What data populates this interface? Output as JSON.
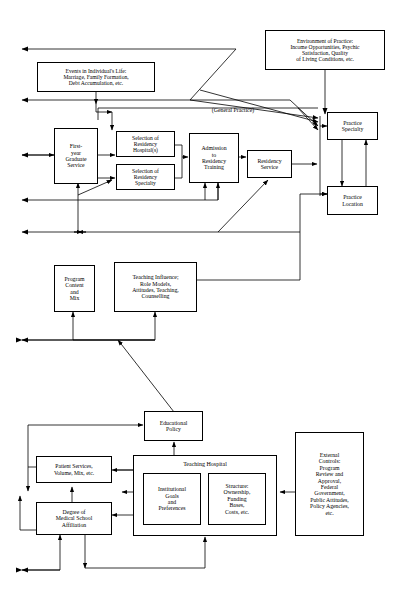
{
  "diagram": {
    "general_practice_label": "(General Practice)",
    "teaching_hospital_label": "Teaching Hospital",
    "nodes": {
      "environment_of_practice": "Environment of Practice: Income Opportunities, Psychic Satisfaction, Quality of Living Conditions, etc.",
      "events_individual_life": "Events in Individual's Life: Marriage, Family Formation, Debt Accumulation, etc.",
      "first_year_graduate_service": "First-year Graduate Service",
      "selection_residency_hospitals": "Selection of Residency Hospital(s)",
      "selection_residency_specialty": "Selection of Residency Specialty",
      "admission_residency_training": "Admission to Residency Training",
      "residency_service": "Residency Service",
      "practice_specialty": "Practice Specialty",
      "practice_location": "Practice Location",
      "program_content_mix": "Program Content and Mix",
      "teaching_influence": "Teaching Influence; Role Models, Attitudes, Teaching, Counselling",
      "educational_policy": "Educational Policy",
      "patient_services": "Patient Services, Volume, Mix, etc.",
      "degree_medical_school_affiliation": "Degree of Medical School Affiliation",
      "institutional_goals": "Institutional Goals and Preferences",
      "structure_ownership": "Structure: Ownership, Funding Bases, Costs, etc.",
      "external_controls": "External Controls: Program Review and Approval, Federal Government, Public Attitudes, Policy Agencies, etc."
    },
    "node_lines": {
      "environment_of_practice": [
        "Environment of Practice:",
        "Income Opportunities, Psychic",
        "Satisfaction, Quality",
        "of Living Conditions, etc."
      ],
      "events_individual_life": [
        "Events in Individual's Life:",
        "Marriage, Family Formation,",
        "Debt Accumulation, etc."
      ],
      "first_year_graduate_service": [
        "First-",
        "year",
        "Graduate",
        "Service"
      ],
      "selection_residency_hospitals": [
        "Selection of",
        "Residency",
        "Hospital(s)"
      ],
      "selection_residency_specialty": [
        "Selection of",
        "Residency",
        "Specialty"
      ],
      "admission_residency_training": [
        "Admission",
        "to",
        "Residency",
        "Training"
      ],
      "residency_service": [
        "Residency",
        "Service"
      ],
      "practice_specialty": [
        "Practice",
        "Specialty"
      ],
      "practice_location": [
        "Practice",
        "Location"
      ],
      "program_content_mix": [
        "Program",
        "Content",
        "and",
        "Mix"
      ],
      "teaching_influence": [
        "Teaching Influence;",
        "Role Models,",
        "Attitudes, Teaching,",
        "Counselling"
      ],
      "educational_policy": [
        "Educational",
        "Policy"
      ],
      "patient_services": [
        "Patient Services,",
        "Volume, Mix, etc."
      ],
      "degree_medical_school_affiliation": [
        "Degree of",
        "Medical School",
        "Affiliation"
      ],
      "institutional_goals": [
        "Institutional",
        "Goals",
        "and",
        "Preferences"
      ],
      "structure_ownership": [
        "Structure:",
        "Ownership,",
        "Funding",
        "Bases,",
        "Costs, etc."
      ],
      "external_controls": [
        "External",
        "Controls:",
        "Program",
        "Review and",
        "Approval,",
        "Federal",
        "Government,",
        "Public Attitudes,",
        "Policy Agencies,",
        "etc."
      ]
    },
    "colors": {
      "stroke": "#000000",
      "fill": "#ffffff",
      "text": "#000000"
    }
  }
}
